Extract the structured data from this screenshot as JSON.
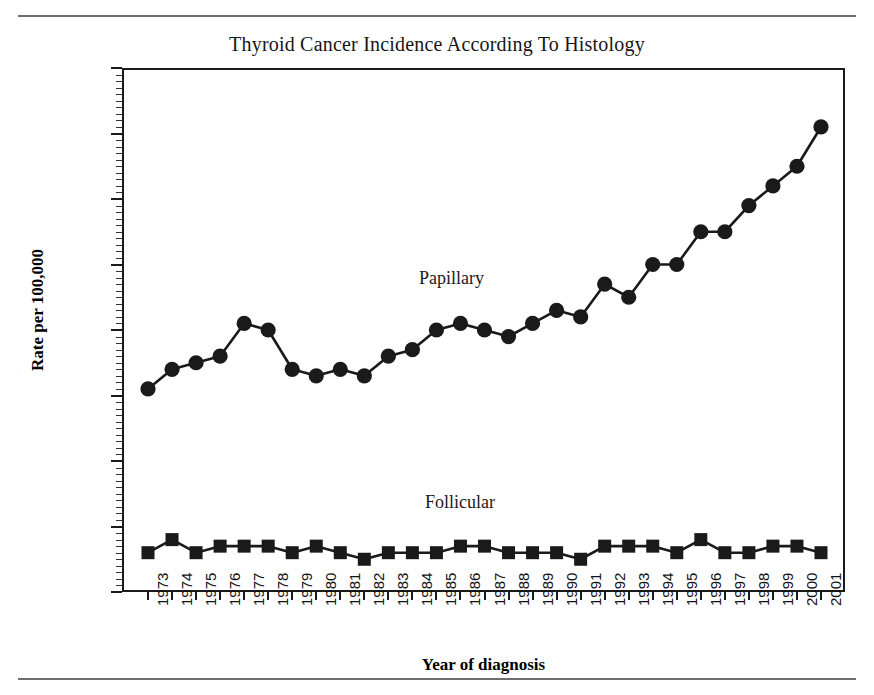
{
  "figure": {
    "title": "Thyroid Cancer Incidence According To Histology",
    "has_top_rule": true,
    "has_bottom_rule": true,
    "background": "#ffffff",
    "ink_color": "#1a1a1a"
  },
  "axes": {
    "y_title": "Rate per 100,000",
    "x_title": "Year of diagnosis",
    "y_ticks": [
      "0.0",
      "1.0",
      "2.0",
      "3.0",
      "4.0",
      "5.0",
      "6.0",
      "7.0",
      "8.0"
    ],
    "y_minor_step": 0.1
  },
  "annotations": {
    "papillary_label": "Papillary",
    "follicular_label": "Follicular"
  },
  "chart_data": {
    "type": "line",
    "title": "Thyroid Cancer Incidence According To Histology",
    "xlabel": "Year of diagnosis",
    "ylabel": "Rate per 100,000",
    "ylim": [
      0,
      8
    ],
    "ytick_step": 1.0,
    "grid": false,
    "legend": "inline-annotations",
    "categories": [
      "1973",
      "1974",
      "1975",
      "1976",
      "1977",
      "1978",
      "1979",
      "1980",
      "1981",
      "1982",
      "1983",
      "1984",
      "1985",
      "1986",
      "1987",
      "1988",
      "1989",
      "1990",
      "1991",
      "1992",
      "1993",
      "1994",
      "1995",
      "1996",
      "1997",
      "1998",
      "1999",
      "2000",
      "2001"
    ],
    "series": [
      {
        "name": "Papillary",
        "marker": "circle",
        "color": "#1a1a1a",
        "values": [
          3.1,
          3.4,
          3.5,
          3.6,
          4.1,
          4.0,
          3.4,
          3.3,
          3.4,
          3.3,
          3.6,
          3.7,
          4.0,
          4.1,
          4.0,
          3.9,
          4.1,
          4.3,
          4.2,
          4.7,
          4.5,
          5.0,
          5.0,
          5.5,
          5.5,
          5.9,
          6.2,
          6.5,
          7.1
        ]
      },
      {
        "name": "Follicular",
        "marker": "square",
        "color": "#1a1a1a",
        "values": [
          0.6,
          0.8,
          0.6,
          0.7,
          0.7,
          0.7,
          0.6,
          0.7,
          0.6,
          0.5,
          0.6,
          0.6,
          0.6,
          0.7,
          0.7,
          0.6,
          0.6,
          0.6,
          0.5,
          0.7,
          0.7,
          0.7,
          0.6,
          0.8,
          0.6,
          0.6,
          0.7,
          0.7,
          0.6
        ]
      }
    ]
  }
}
